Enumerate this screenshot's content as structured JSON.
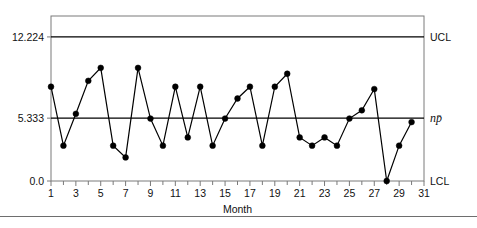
{
  "chart_data": {
    "type": "line",
    "title": "",
    "subtitle": "",
    "xlabel": "Month",
    "ylabel": "",
    "x": [
      1,
      2,
      3,
      4,
      5,
      6,
      7,
      8,
      9,
      10,
      11,
      12,
      13,
      14,
      15,
      16,
      17,
      18,
      19,
      20,
      21,
      22,
      23,
      24,
      25,
      26,
      27,
      28,
      29,
      30
    ],
    "values": [
      8.0,
      3.0,
      5.7,
      8.5,
      9.6,
      3.0,
      2.0,
      9.6,
      5.3,
      3.0,
      8.0,
      3.7,
      8.0,
      3.0,
      5.3,
      7.0,
      8.0,
      3.0,
      8.0,
      9.1,
      3.7,
      3.0,
      3.7,
      3.0,
      5.3,
      6.0,
      7.8,
      0.0,
      3.0,
      5.0
    ],
    "series": [
      {
        "name": "np",
        "values": [
          8.0,
          3.0,
          5.7,
          8.5,
          9.6,
          3.0,
          2.0,
          9.6,
          5.3,
          3.0,
          8.0,
          3.7,
          8.0,
          3.0,
          5.3,
          7.0,
          8.0,
          3.0,
          8.0,
          9.1,
          3.7,
          3.0,
          3.7,
          3.0,
          5.3,
          6.0,
          7.8,
          0.0,
          3.0,
          5.0
        ]
      }
    ],
    "xlim": [
      1,
      31
    ],
    "ylim": [
      0.0,
      14.0
    ],
    "xticks": [
      1,
      3,
      5,
      7,
      9,
      11,
      13,
      15,
      17,
      19,
      21,
      23,
      25,
      27,
      29,
      31
    ],
    "xtick_labels": [
      "1",
      "3",
      "5",
      "7",
      "9",
      "11",
      "13",
      "15",
      "17",
      "19",
      "21",
      "23",
      "25",
      "27",
      "29",
      "31"
    ],
    "xminor_ticks": [
      2,
      4,
      6,
      8,
      10,
      12,
      14,
      16,
      18,
      20,
      22,
      24,
      26,
      28,
      30
    ],
    "yticks": [
      0.0,
      5.333,
      12.224
    ],
    "ytick_labels": [
      "0.0",
      "5.333",
      "12.224"
    ],
    "grid": false,
    "legend_position": "right-outside",
    "control_limits": [
      {
        "id": "ucl",
        "label": "UCL",
        "value": 12.224,
        "value_label": "12.224"
      },
      {
        "id": "center",
        "label": "np̄",
        "value": 5.333,
        "value_label": "5.333"
      },
      {
        "id": "lcl",
        "label": "LCL",
        "value": 0.0,
        "value_label": "0.0"
      }
    ],
    "colors": {
      "line": "#000000",
      "marker": "#000000",
      "axis": "#7a7a7a",
      "limit_line": "#000000",
      "background": "#ffffff",
      "text": "#111111",
      "footer_rule": "#6e6e6e"
    }
  },
  "figure": {
    "axis_title_x": "Month",
    "ucl_label": "UCL",
    "lcl_label": "LCL",
    "center_label": "np̄",
    "ytick_top": "12.224",
    "ytick_center": "5.333",
    "ytick_bottom": "0.0"
  }
}
